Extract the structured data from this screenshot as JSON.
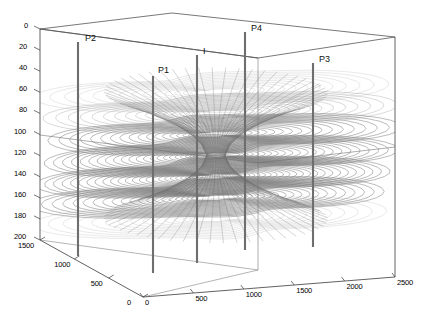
{
  "figure": {
    "kind": "3d-contour-plot",
    "background_color": "#ffffff",
    "axis_color": "#3a3a3a",
    "contour_color": "#808080",
    "well_color": "#6e6e6e"
  },
  "axes": {
    "z_axis": {
      "name": "depth-axis",
      "orientation": "vertical-left",
      "ticks": [
        "0",
        "20",
        "40",
        "60",
        "80",
        "100",
        "120",
        "140",
        "160",
        "180",
        "200"
      ],
      "min": 0,
      "max": 200
    },
    "y_axis": {
      "name": "y-axis",
      "orientation": "bottom-left-receding",
      "ticks": [
        "1500",
        "1000",
        "500",
        "0"
      ],
      "min": 0,
      "max": 1500
    },
    "x_axis": {
      "name": "x-axis",
      "orientation": "bottom-right",
      "ticks": [
        "0",
        "500",
        "1000",
        "1500",
        "2000",
        "2500"
      ],
      "min": 0,
      "max": 2500
    }
  },
  "wells": [
    {
      "label": "P2",
      "type": "producer",
      "x_px": 78,
      "top_px": 42,
      "bottom_px": 256,
      "label_x": 85,
      "label_y": 33
    },
    {
      "label": "P1",
      "type": "producer",
      "x_px": 153,
      "top_px": 76,
      "bottom_px": 273,
      "label_x": 158,
      "label_y": 65
    },
    {
      "label": "I",
      "type": "injector",
      "x_px": 197,
      "top_px": 55,
      "bottom_px": 263,
      "label_x": 203,
      "label_y": 46
    },
    {
      "label": "P4",
      "type": "producer",
      "x_px": 245,
      "top_px": 32,
      "bottom_px": 250,
      "label_x": 251,
      "label_y": 23
    },
    {
      "label": "P3",
      "type": "producer",
      "x_px": 313,
      "top_px": 63,
      "bottom_px": 247,
      "label_x": 319,
      "label_y": 54
    }
  ],
  "chart_data": {
    "type": "contour",
    "title": "",
    "xlabel": "",
    "ylabel": "",
    "zlabel": "",
    "xlim": [
      0,
      2500
    ],
    "ylim": [
      0,
      1500
    ],
    "zlim": [
      0,
      200
    ],
    "z_inverted": true,
    "grid": false,
    "legend": null,
    "x_ticks": [
      0,
      500,
      1000,
      1500,
      2000,
      2500
    ],
    "y_ticks": [
      0,
      500,
      1000,
      1500
    ],
    "z_ticks": [
      0,
      20,
      40,
      60,
      80,
      100,
      120,
      140,
      160,
      180,
      200
    ],
    "contour_layers": [
      {
        "depth": 40,
        "n_contours": 14,
        "center_x": 1200,
        "center_y": 700
      },
      {
        "depth": 60,
        "n_contours": 16,
        "center_x": 1200,
        "center_y": 700
      },
      {
        "depth": 80,
        "n_contours": 18,
        "center_x": 1200,
        "center_y": 700
      },
      {
        "depth": 100,
        "n_contours": 22,
        "center_x": 1200,
        "center_y": 700
      },
      {
        "depth": 120,
        "n_contours": 24,
        "center_x": 1200,
        "center_y": 700
      },
      {
        "depth": 140,
        "n_contours": 20,
        "center_x": 1200,
        "center_y": 700
      },
      {
        "depth": 160,
        "n_contours": 14,
        "center_x": 1200,
        "center_y": 700
      }
    ],
    "series": [
      {
        "name": "I",
        "values": [
          1200,
          700
        ]
      },
      {
        "name": "P1",
        "values": [
          700,
          500
        ]
      },
      {
        "name": "P2",
        "values": [
          300,
          1100
        ]
      },
      {
        "name": "P3",
        "values": [
          2100,
          600
        ]
      },
      {
        "name": "P4",
        "values": [
          1700,
          1200
        ]
      }
    ]
  }
}
